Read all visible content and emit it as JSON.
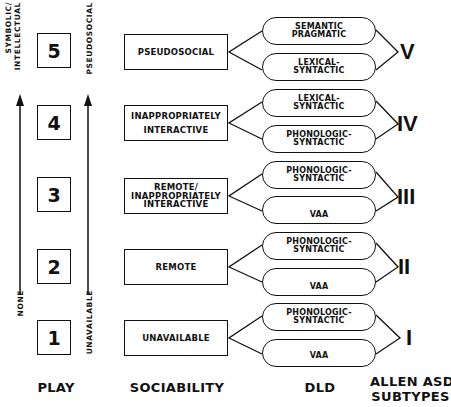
{
  "play": {
    "column_label": "PLAY",
    "levels": [
      "5",
      "4",
      "3",
      "2",
      "1"
    ],
    "axis_top_label": "SYMBOLIC/\nINTELLECTUAL",
    "axis_bottom_label": "NONE"
  },
  "sociability": {
    "column_label": "SOCIABILITY",
    "axis_top_label": "PSEUDOSOCIAL",
    "axis_bottom_label": "UNAVAILABLE",
    "levels": [
      "PSEUDOSOCIAL",
      "INAPPROPRIATELY\nINTERACTIVE",
      "REMOTE/\nINAPPROPRIATELY\nINTERACTIVE",
      "REMOTE",
      "UNAVAILABLE"
    ]
  },
  "dld": {
    "column_label": "DLD",
    "pairs": [
      [
        "SEMANTIC\nPRAGMATIC",
        "LEXICAL-\nSYNTACTIC"
      ],
      [
        "LEXICAL-\nSYNTACTIC",
        "PHONOLOGIC-\nSYNTACTIC"
      ],
      [
        "PHONOLOGIC-\nSYNTACTIC",
        "VAA"
      ],
      [
        "PHONOLOGIC-\nSYNTACTIC",
        "VAA"
      ],
      [
        "PHONOLOGIC-\nSYNTACTIC",
        "VAA"
      ]
    ]
  },
  "subtypes": {
    "column_label": "ALLEN ASD\nSUBTYPES",
    "levels": [
      "V",
      "IV",
      "III",
      "II",
      "I"
    ]
  }
}
